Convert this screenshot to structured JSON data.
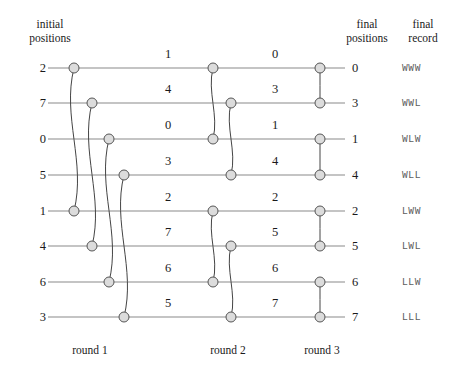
{
  "headers": {
    "initial": "initial\npositions",
    "initial_line1": "initial",
    "initial_line2": "positions",
    "final_positions_line1": "final",
    "final_positions_line2": "positions",
    "final_record_line1": "final",
    "final_record_line2": "record"
  },
  "rounds": [
    {
      "label": "round 1"
    },
    {
      "label": "round 2"
    },
    {
      "label": "round 3"
    }
  ],
  "rows": [
    {
      "start": "2",
      "after_round1": "1",
      "after_round2": "0",
      "final_position": "0",
      "final_record": "WWW"
    },
    {
      "start": "7",
      "after_round1": "4",
      "after_round2": "3",
      "final_position": "3",
      "final_record": "WWL"
    },
    {
      "start": "0",
      "after_round1": "0",
      "after_round2": "1",
      "final_position": "1",
      "final_record": "WLW"
    },
    {
      "start": "5",
      "after_round1": "3",
      "after_round2": "4",
      "final_position": "4",
      "final_record": "WLL"
    },
    {
      "start": "1",
      "after_round1": "2",
      "after_round2": "2",
      "final_position": "2",
      "final_record": "LWW"
    },
    {
      "start": "4",
      "after_round1": "7",
      "after_round2": "5",
      "final_position": "5",
      "final_record": "LWL"
    },
    {
      "start": "6",
      "after_round1": "6",
      "after_round2": "6",
      "final_position": "6",
      "final_record": "LLW"
    },
    {
      "start": "3",
      "after_round1": "5",
      "after_round2": "7",
      "final_position": "7",
      "final_record": "LLL"
    }
  ],
  "colors": {
    "wire": "#8a8a8a",
    "node_fill": "#dcdcdc",
    "node_stroke": "#555555",
    "connector": "#444444",
    "text": "#1a1a1a",
    "record_text": "#5d5d5d"
  },
  "chart_data": {
    "type": "diagram",
    "row_y": [
      68,
      103,
      139,
      175,
      211,
      246,
      282,
      317
    ],
    "nodes": [
      {
        "round": 1,
        "row": 0,
        "x": 74
      },
      {
        "round": 1,
        "row": 1,
        "x": 92
      },
      {
        "round": 1,
        "row": 2,
        "x": 109
      },
      {
        "round": 1,
        "row": 3,
        "x": 124
      },
      {
        "round": 1,
        "row": 4,
        "x": 74
      },
      {
        "round": 1,
        "row": 5,
        "x": 92
      },
      {
        "round": 1,
        "row": 6,
        "x": 109
      },
      {
        "round": 1,
        "row": 7,
        "x": 124
      },
      {
        "round": 2,
        "row": 0,
        "x": 213
      },
      {
        "round": 2,
        "row": 1,
        "x": 231
      },
      {
        "round": 2,
        "row": 2,
        "x": 213
      },
      {
        "round": 2,
        "row": 3,
        "x": 231
      },
      {
        "round": 2,
        "row": 4,
        "x": 213
      },
      {
        "round": 2,
        "row": 5,
        "x": 231
      },
      {
        "round": 2,
        "row": 6,
        "x": 213
      },
      {
        "round": 2,
        "row": 7,
        "x": 231
      },
      {
        "round": 3,
        "row": 0,
        "x": 320
      },
      {
        "round": 3,
        "row": 1,
        "x": 320
      },
      {
        "round": 3,
        "row": 2,
        "x": 320
      },
      {
        "round": 3,
        "row": 3,
        "x": 320
      },
      {
        "round": 3,
        "row": 4,
        "x": 320
      },
      {
        "round": 3,
        "row": 5,
        "x": 320
      },
      {
        "round": 3,
        "row": 6,
        "x": 320
      },
      {
        "round": 3,
        "row": 7,
        "x": 320
      }
    ],
    "pairings": [
      {
        "round": 1,
        "top_row": 0,
        "bottom_row": 4
      },
      {
        "round": 1,
        "top_row": 1,
        "bottom_row": 5
      },
      {
        "round": 1,
        "top_row": 2,
        "bottom_row": 6
      },
      {
        "round": 1,
        "top_row": 3,
        "bottom_row": 7
      },
      {
        "round": 2,
        "top_row": 0,
        "bottom_row": 2
      },
      {
        "round": 2,
        "top_row": 1,
        "bottom_row": 3
      },
      {
        "round": 2,
        "top_row": 4,
        "bottom_row": 6
      },
      {
        "round": 2,
        "top_row": 5,
        "bottom_row": 7
      },
      {
        "round": 3,
        "top_row": 0,
        "bottom_row": 1
      },
      {
        "round": 3,
        "top_row": 2,
        "bottom_row": 3
      },
      {
        "round": 3,
        "top_row": 4,
        "bottom_row": 5
      },
      {
        "round": 3,
        "top_row": 6,
        "bottom_row": 7
      }
    ],
    "wire_x_start": 48,
    "wire_x_end": 345,
    "mid_label_x": [
      168,
      275
    ],
    "node_radius": 5
  }
}
